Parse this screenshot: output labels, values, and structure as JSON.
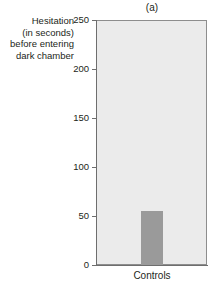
{
  "chart_data": {
    "type": "bar",
    "title": "(a)",
    "xlabel": "",
    "ylabel": "Hesitation (in seconds) before entering dark chamber",
    "ylabel_lines": [
      "Hesitation",
      "(in seconds)",
      "before entering",
      "dark chamber"
    ],
    "categories": [
      "Controls"
    ],
    "values": [
      55
    ],
    "ylim": [
      0,
      250
    ],
    "yticks": [
      0,
      50,
      100,
      150,
      200,
      250
    ],
    "ytick_labels": [
      "0",
      "50",
      "100",
      "150",
      "200",
      "250"
    ],
    "grid": false,
    "legend": null,
    "bar_color": "#9a9a9a",
    "plot_background": "#ebebeb",
    "axis_color": "#6e6e6e",
    "text_color": "#231f20"
  }
}
